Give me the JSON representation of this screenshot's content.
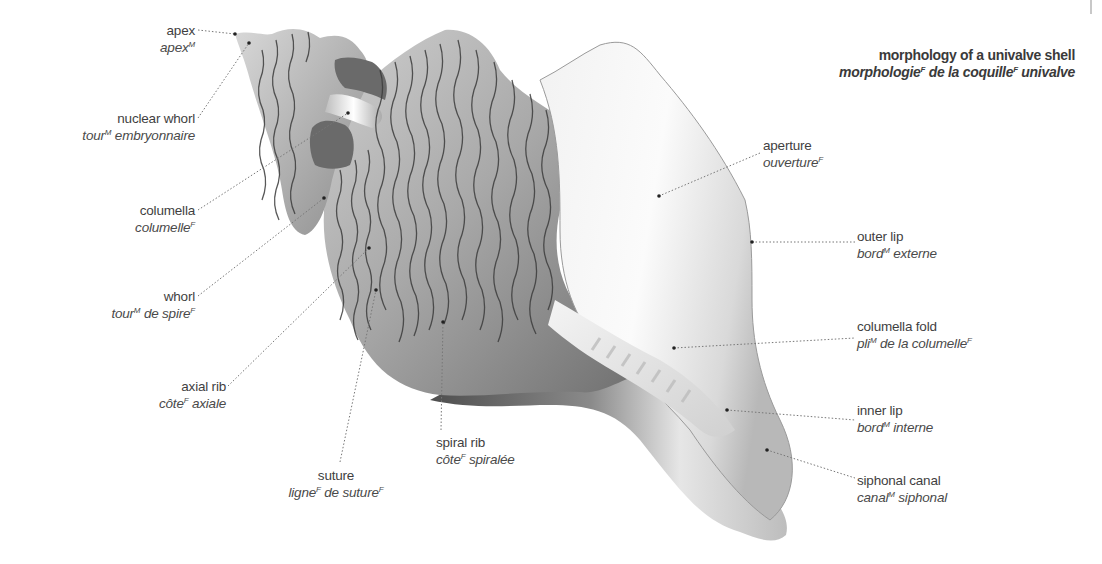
{
  "title": {
    "en": "morphology of a univalve shell",
    "fr_parts": [
      "morphologie",
      "F",
      " de la coquille",
      "F",
      " univalve"
    ]
  },
  "labels": [
    {
      "id": "apex",
      "en": "apex",
      "fr": [
        {
          "t": "apex"
        },
        {
          "sup": "M"
        }
      ]
    },
    {
      "id": "nuclear-whorl",
      "en": "nuclear whorl",
      "fr": [
        {
          "t": "tour"
        },
        {
          "sup": "M"
        },
        {
          "t": " embryonnaire"
        }
      ]
    },
    {
      "id": "columella",
      "en": "columella",
      "fr": [
        {
          "t": "columelle"
        },
        {
          "sup": "F"
        }
      ]
    },
    {
      "id": "whorl",
      "en": "whorl",
      "fr": [
        {
          "t": "tour"
        },
        {
          "sup": "M"
        },
        {
          "t": " de spire"
        },
        {
          "sup": "F"
        }
      ]
    },
    {
      "id": "axial-rib",
      "en": "axial rib",
      "fr": [
        {
          "t": "côte"
        },
        {
          "sup": "F"
        },
        {
          "t": " axiale"
        }
      ]
    },
    {
      "id": "suture",
      "en": "suture",
      "fr": [
        {
          "t": "ligne"
        },
        {
          "sup": "F"
        },
        {
          "t": " de suture"
        },
        {
          "sup": "F"
        }
      ]
    },
    {
      "id": "spiral-rib",
      "en": "spiral rib",
      "fr": [
        {
          "t": "côte"
        },
        {
          "sup": "F"
        },
        {
          "t": " spiralée"
        }
      ]
    },
    {
      "id": "aperture",
      "en": "aperture",
      "fr": [
        {
          "t": "ouverture"
        },
        {
          "sup": "F"
        }
      ]
    },
    {
      "id": "outer-lip",
      "en": "outer lip",
      "fr": [
        {
          "t": "bord"
        },
        {
          "sup": "M"
        },
        {
          "t": " externe"
        }
      ]
    },
    {
      "id": "columella-fold",
      "en": "columella fold",
      "fr": [
        {
          "t": "pli"
        },
        {
          "sup": "M"
        },
        {
          "t": " de la columelle"
        },
        {
          "sup": "F"
        }
      ]
    },
    {
      "id": "inner-lip",
      "en": "inner lip",
      "fr": [
        {
          "t": "bord"
        },
        {
          "sup": "M"
        },
        {
          "t": " interne"
        }
      ]
    },
    {
      "id": "siphonal-canal",
      "en": "siphonal canal",
      "fr": [
        {
          "t": "canal"
        },
        {
          "sup": "M"
        },
        {
          "t": " siphonal"
        }
      ]
    }
  ],
  "colors": {
    "text": "#3f3f3f",
    "leader": "#777777",
    "shell_dark": "#5a5a5a",
    "shell_mid": "#9a9a9a",
    "shell_light": "#e8e8e8",
    "rib_line": "#3c3c3c"
  }
}
